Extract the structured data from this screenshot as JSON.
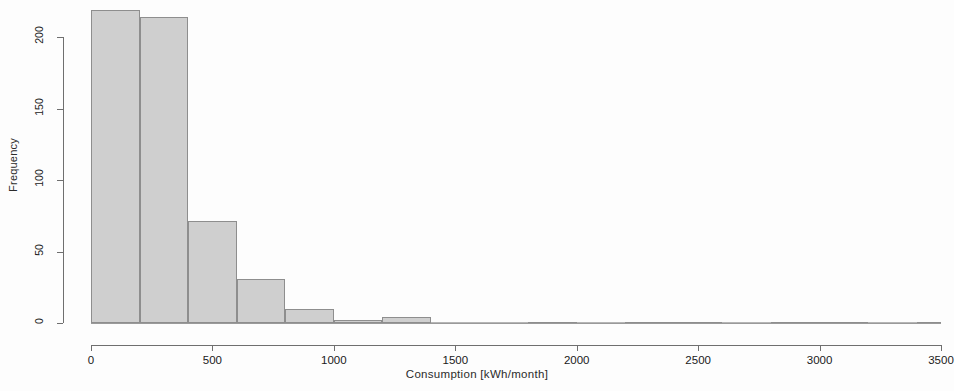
{
  "chart_data": {
    "type": "bar",
    "title": "",
    "subtitle": "",
    "xlabel": "Consumption  [kWh/month]",
    "ylabel": "Frequency",
    "grid": false,
    "legend": false,
    "legend_position": "none",
    "bin_width": 200,
    "xlim": [
      0,
      3500
    ],
    "ylim": [
      0,
      225
    ],
    "xticks": [
      0,
      500,
      1000,
      1500,
      2000,
      2500,
      3000,
      3500
    ],
    "xtick_labels": [
      "0",
      "500",
      "1000",
      "1500",
      "2000",
      "2500",
      "3000",
      "3500"
    ],
    "yticks": [
      0,
      50,
      100,
      150,
      200
    ],
    "ytick_labels": [
      "0",
      "50",
      "100",
      "150",
      "200"
    ],
    "bar_fill": "#cfcfcf",
    "bar_stroke": "#8e8e8e",
    "axis_color": "#6f6f6f",
    "bins": [
      {
        "x0": 0,
        "x1": 200,
        "value": 219
      },
      {
        "x0": 200,
        "x1": 400,
        "value": 214
      },
      {
        "x0": 400,
        "x1": 600,
        "value": 71
      },
      {
        "x0": 600,
        "x1": 800,
        "value": 31
      },
      {
        "x0": 800,
        "x1": 1000,
        "value": 10
      },
      {
        "x0": 1000,
        "x1": 1200,
        "value": 2
      },
      {
        "x0": 1200,
        "x1": 1400,
        "value": 4
      },
      {
        "x0": 1400,
        "x1": 1600,
        "value": 0
      },
      {
        "x0": 1600,
        "x1": 1800,
        "value": 0
      },
      {
        "x0": 1800,
        "x1": 2000,
        "value": 1
      },
      {
        "x0": 2000,
        "x1": 2200,
        "value": 0
      },
      {
        "x0": 2200,
        "x1": 2400,
        "value": 1
      },
      {
        "x0": 2400,
        "x1": 2600,
        "value": 1
      },
      {
        "x0": 2600,
        "x1": 2800,
        "value": 0
      },
      {
        "x0": 2800,
        "x1": 3000,
        "value": 1
      },
      {
        "x0": 3000,
        "x1": 3200,
        "value": 1
      },
      {
        "x0": 3200,
        "x1": 3400,
        "value": 0
      },
      {
        "x0": 3400,
        "x1": 3500,
        "value": 1
      }
    ],
    "categories": [
      "0-200",
      "200-400",
      "400-600",
      "600-800",
      "800-1000",
      "1000-1200",
      "1200-1400",
      "1400-1600",
      "1600-1800",
      "1800-2000",
      "2000-2200",
      "2200-2400",
      "2400-2600",
      "2600-2800",
      "2800-3000",
      "3000-3200",
      "3200-3400",
      "3400-3600"
    ],
    "values": [
      219,
      214,
      71,
      31,
      10,
      2,
      4,
      0,
      0,
      1,
      0,
      1,
      1,
      0,
      1,
      1,
      0,
      1
    ]
  }
}
